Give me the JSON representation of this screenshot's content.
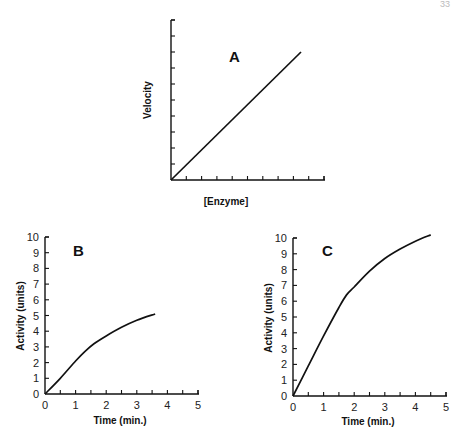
{
  "page_number_fragment": "33",
  "chart_data": [
    {
      "type": "line",
      "panel": "A",
      "title": "A",
      "xlabel": "[Enzyme]",
      "ylabel": "Velocity",
      "x_ticks_count": 10,
      "y_ticks_count": 10,
      "tick_labels": false,
      "grid": false,
      "series": [
        {
          "name": "velocity",
          "x": [
            0,
            8.5
          ],
          "y": [
            0,
            8.1
          ]
        }
      ]
    },
    {
      "type": "line",
      "panel": "B",
      "title": "B",
      "xlabel": "Time (min.)",
      "ylabel": "Activity (units)",
      "xlim": [
        0,
        5
      ],
      "ylim": [
        0,
        10
      ],
      "x_ticks": [
        0,
        1,
        2,
        3,
        4,
        5
      ],
      "y_ticks": [
        0,
        1,
        2,
        3,
        4,
        5,
        6,
        7,
        8,
        9,
        10
      ],
      "grid": false,
      "series": [
        {
          "name": "activity",
          "x": [
            0,
            0.5,
            1.0,
            1.3,
            1.6,
            2.0,
            2.5,
            3.0,
            3.6
          ],
          "y": [
            0,
            1.0,
            2.1,
            2.7,
            3.2,
            3.7,
            4.25,
            4.7,
            5.1
          ]
        }
      ]
    },
    {
      "type": "line",
      "panel": "C",
      "title": "C",
      "xlabel": "Time (min.)",
      "ylabel": "Activity (units)",
      "xlim": [
        0,
        5
      ],
      "ylim": [
        0,
        10
      ],
      "x_ticks": [
        0,
        1,
        2,
        3,
        4,
        5
      ],
      "y_ticks": [
        0,
        1,
        2,
        3,
        4,
        5,
        6,
        7,
        8,
        9,
        10
      ],
      "grid": false,
      "series": [
        {
          "name": "activity",
          "x": [
            0,
            0.5,
            1.0,
            1.5,
            1.75,
            2.0,
            2.5,
            3.0,
            3.5,
            4.0,
            4.5
          ],
          "y": [
            0,
            1.9,
            3.8,
            5.6,
            6.4,
            6.9,
            7.9,
            8.7,
            9.3,
            9.8,
            10.2
          ]
        }
      ]
    }
  ]
}
